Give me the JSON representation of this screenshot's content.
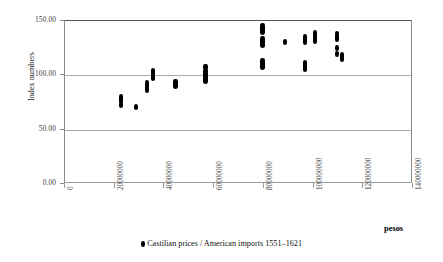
{
  "chart_data": {
    "type": "scatter",
    "title": "",
    "xlabel": "pesos",
    "ylabel": "Index numbers",
    "xlim": [
      0,
      140000000
    ],
    "ylim": [
      0,
      150
    ],
    "grid": true,
    "legend_position": "bottom-center",
    "series": [
      {
        "name": "Castilian prices / American imports 1551–1621",
        "marker": "diamond",
        "color": "#000000",
        "points": [
          [
            22500000,
            80.0
          ],
          [
            22500000,
            78.5
          ],
          [
            22500000,
            76.5
          ],
          [
            22500000,
            73.0
          ],
          [
            28500000,
            71.0
          ],
          [
            33000000,
            92.5
          ],
          [
            33000000,
            90.5
          ],
          [
            33000000,
            88.5
          ],
          [
            33000000,
            86.5
          ],
          [
            35500000,
            104.0
          ],
          [
            35500000,
            101.0
          ],
          [
            35500000,
            99.0
          ],
          [
            35500000,
            97.5
          ],
          [
            44500000,
            93.5
          ],
          [
            44500000,
            92.0
          ],
          [
            44500000,
            90.5
          ],
          [
            56500000,
            107.5
          ],
          [
            56500000,
            104.0
          ],
          [
            56500000,
            101.0
          ],
          [
            56500000,
            99.0
          ],
          [
            56500000,
            96.5
          ],
          [
            56500000,
            94.5
          ],
          [
            79500000,
            145.5
          ],
          [
            79500000,
            143.5
          ],
          [
            79500000,
            141.5
          ],
          [
            79500000,
            139.5
          ],
          [
            79500000,
            133.0
          ],
          [
            79500000,
            130.5
          ],
          [
            79500000,
            128.0
          ],
          [
            79500000,
            113.5
          ],
          [
            79500000,
            111.0
          ],
          [
            79500000,
            109.0
          ],
          [
            79500000,
            107.5
          ],
          [
            88500000,
            130.5
          ],
          [
            96500000,
            135.0
          ],
          [
            96500000,
            133.0
          ],
          [
            96500000,
            131.0
          ],
          [
            96500000,
            111.0
          ],
          [
            96500000,
            109.0
          ],
          [
            96500000,
            107.0
          ],
          [
            96500000,
            105.5
          ],
          [
            100500000,
            139.0
          ],
          [
            100500000,
            136.0
          ],
          [
            100500000,
            133.5
          ],
          [
            100500000,
            131.5
          ],
          [
            109500000,
            138.0
          ],
          [
            109500000,
            135.5
          ],
          [
            109500000,
            133.5
          ],
          [
            109500000,
            125.0
          ],
          [
            109500000,
            119.5
          ],
          [
            111500000,
            119.0
          ],
          [
            111500000,
            116.5
          ],
          [
            111500000,
            115.0
          ]
        ]
      }
    ],
    "yticks": [
      {
        "value": 0,
        "label": "0.00"
      },
      {
        "value": 50,
        "label": "50.00"
      },
      {
        "value": 100,
        "label": "100.00"
      },
      {
        "value": 150,
        "label": "150.00"
      }
    ],
    "xticks": [
      {
        "value": 0,
        "label": "0"
      },
      {
        "value": 20000000,
        "label": "20000000"
      },
      {
        "value": 40000000,
        "label": "40000000"
      },
      {
        "value": 60000000,
        "label": "60000000"
      },
      {
        "value": 80000000,
        "label": "80000000"
      },
      {
        "value": 100000000,
        "label": "100000000"
      },
      {
        "value": 120000000,
        "label": "120000000"
      },
      {
        "value": 140000000,
        "label": "140000000"
      }
    ]
  },
  "legend": {
    "entry_label": "Castilian prices / American imports 1551–1621"
  },
  "axis_titles": {
    "y": "Index numbers",
    "x": "pesos"
  }
}
